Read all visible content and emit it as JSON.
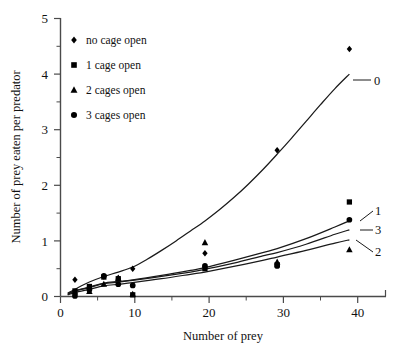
{
  "chart_data": {
    "type": "scatter",
    "title": "",
    "xlabel": "Number of prey",
    "ylabel": "Number of prey eaten per predator",
    "xlim": [
      0,
      45
    ],
    "ylim": [
      0,
      5
    ],
    "xticks": [
      0,
      10,
      20,
      30,
      40
    ],
    "yticks": [
      0,
      1,
      2,
      3,
      4,
      5
    ],
    "xtick_labels": [
      "0",
      "10",
      "20",
      "30",
      "40"
    ],
    "ytick_labels": [
      "0",
      "1",
      "2",
      "3",
      "4",
      "5"
    ],
    "x_minor_ticks": [
      5,
      15,
      25,
      35,
      45
    ],
    "y_minor_ticks": [
      0.5,
      1.5,
      2.5,
      3.5,
      4.5
    ],
    "grid": false,
    "legend_position": "upper-left",
    "series": [
      {
        "name": "no cage open",
        "marker": "diamond",
        "curve_label": "0",
        "x": [
          2,
          4,
          6,
          8,
          10,
          20,
          30,
          40
        ],
        "y": [
          0.3,
          0.17,
          0.36,
          0.33,
          0.5,
          0.78,
          2.63,
          4.45
        ]
      },
      {
        "name": "1 cage open",
        "marker": "square",
        "curve_label": "1",
        "x": [
          2,
          4,
          6,
          8,
          10,
          20,
          30,
          40
        ],
        "y": [
          0.1,
          0.18,
          0.35,
          0.32,
          0.03,
          0.5,
          0.57,
          1.7
        ]
      },
      {
        "name": "2 cages open",
        "marker": "triangle",
        "curve_label": "2",
        "x": [
          2,
          4,
          6,
          8,
          10,
          20,
          30,
          40
        ],
        "y": [
          0.08,
          0.09,
          0.22,
          0.33,
          0.04,
          0.97,
          0.62,
          0.84
        ]
      },
      {
        "name": "3 cages open",
        "marker": "circle",
        "curve_label": "3",
        "x": [
          2,
          4,
          6,
          8,
          10,
          20,
          30,
          40
        ],
        "y": [
          0.01,
          0.12,
          0.37,
          0.22,
          0.2,
          0.55,
          0.55,
          1.38
        ]
      }
    ],
    "fitted_curves": [
      {
        "label": "0",
        "points": [
          [
            1,
            0.06
          ],
          [
            2,
            0.13
          ],
          [
            4,
            0.26
          ],
          [
            6,
            0.36
          ],
          [
            8,
            0.44
          ],
          [
            10,
            0.53
          ],
          [
            12,
            0.67
          ],
          [
            14,
            0.83
          ],
          [
            16,
            1.0
          ],
          [
            18,
            1.18
          ],
          [
            20,
            1.36
          ],
          [
            22,
            1.56
          ],
          [
            24,
            1.78
          ],
          [
            26,
            2.02
          ],
          [
            28,
            2.28
          ],
          [
            30,
            2.56
          ],
          [
            32,
            2.85
          ],
          [
            34,
            3.15
          ],
          [
            36,
            3.45
          ],
          [
            38,
            3.74
          ],
          [
            40,
            4.0
          ]
        ]
      },
      {
        "label": "1",
        "points": [
          [
            1,
            0.04
          ],
          [
            2,
            0.1
          ],
          [
            4,
            0.17
          ],
          [
            6,
            0.24
          ],
          [
            8,
            0.27
          ],
          [
            10,
            0.3
          ],
          [
            14,
            0.38
          ],
          [
            18,
            0.47
          ],
          [
            20,
            0.52
          ],
          [
            24,
            0.65
          ],
          [
            28,
            0.79
          ],
          [
            30,
            0.86
          ],
          [
            34,
            1.04
          ],
          [
            38,
            1.25
          ],
          [
            40,
            1.36
          ]
        ]
      },
      {
        "label": "3",
        "points": [
          [
            1,
            0.04
          ],
          [
            2,
            0.1
          ],
          [
            4,
            0.16
          ],
          [
            6,
            0.23
          ],
          [
            8,
            0.26
          ],
          [
            10,
            0.29
          ],
          [
            14,
            0.36
          ],
          [
            18,
            0.44
          ],
          [
            20,
            0.49
          ],
          [
            24,
            0.6
          ],
          [
            28,
            0.73
          ],
          [
            30,
            0.79
          ],
          [
            34,
            0.94
          ],
          [
            38,
            1.12
          ],
          [
            40,
            1.2
          ]
        ]
      },
      {
        "label": "2",
        "points": [
          [
            1,
            0.03
          ],
          [
            2,
            0.07
          ],
          [
            4,
            0.13
          ],
          [
            6,
            0.19
          ],
          [
            8,
            0.22
          ],
          [
            10,
            0.25
          ],
          [
            14,
            0.32
          ],
          [
            18,
            0.4
          ],
          [
            20,
            0.44
          ],
          [
            24,
            0.54
          ],
          [
            28,
            0.65
          ],
          [
            30,
            0.71
          ],
          [
            34,
            0.83
          ],
          [
            38,
            0.96
          ],
          [
            40,
            1.02
          ]
        ]
      }
    ]
  },
  "legend": {
    "items": [
      {
        "label": "no cage open",
        "marker": "diamond"
      },
      {
        "label": "1 cage open",
        "marker": "square"
      },
      {
        "label": "2 cages open",
        "marker": "triangle"
      },
      {
        "label": "3 cages open",
        "marker": "circle"
      }
    ]
  },
  "curve_labels": {
    "c0": "0",
    "c1": "1",
    "c3": "3",
    "c2": "2"
  },
  "axes": {
    "x_title": "Number of prey",
    "y_title": "Number of prey eaten per predator",
    "x_tick_0": "0",
    "x_tick_10": "10",
    "x_tick_20": "20",
    "x_tick_30": "30",
    "x_tick_40": "40",
    "y_tick_0": "0",
    "y_tick_1": "1",
    "y_tick_2": "2",
    "y_tick_3": "3",
    "y_tick_4": "4",
    "y_tick_5": "5"
  }
}
